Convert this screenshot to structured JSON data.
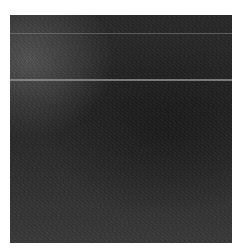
{
  "image": {
    "description": "Dark grainy textured surface with two faint horizontal lighter lines",
    "colors": {
      "surface": "#2a2a2a",
      "line": "#969696",
      "border": "#ffffff"
    }
  }
}
